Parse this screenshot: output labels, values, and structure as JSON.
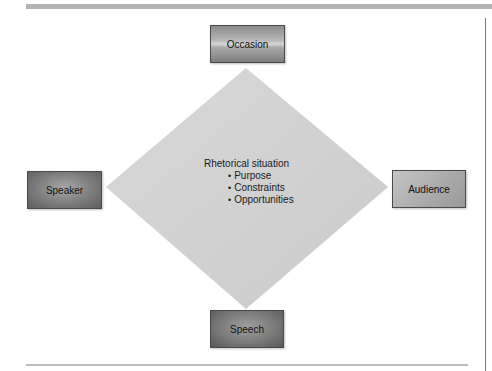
{
  "diagram": {
    "center": {
      "title": "Rhetorical situation",
      "items": [
        "Purpose",
        "Constraints",
        "Opportunities"
      ]
    },
    "nodes": {
      "top": "Occasion",
      "left": "Speaker",
      "right": "Audience",
      "bottom": "Speech"
    },
    "colors": {
      "diamond_fill": "#d2d2d2",
      "box_dark": "#6e6e6e",
      "box_light": "#b0b0b0",
      "rule": "#b4b4b4"
    }
  }
}
